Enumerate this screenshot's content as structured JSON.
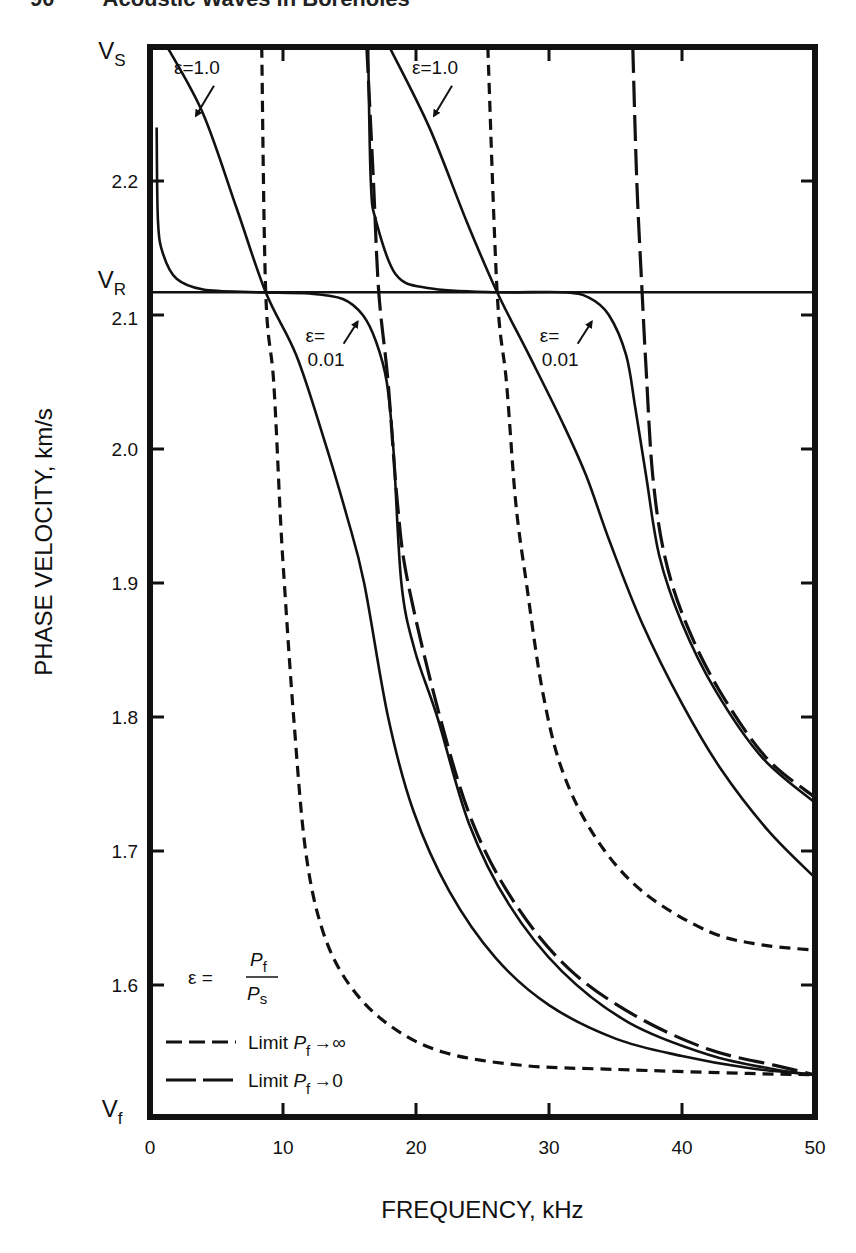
{
  "page": {
    "header": "90        Acoustic Waves in Boreholes"
  },
  "chart_data": {
    "type": "line",
    "title": "",
    "xlabel": "FREQUENCY, kHz",
    "ylabel": "PHASE VELOCITY, km/s",
    "xlim": [
      0,
      50
    ],
    "ylim": [
      1.503,
      2.3
    ],
    "grid": false,
    "x_ticks": [
      0,
      10,
      20,
      30,
      40,
      50
    ],
    "x_tick_labels": [
      "0",
      "10",
      "20",
      "30",
      "40",
      "50"
    ],
    "y_ticks": [
      1.6,
      1.7,
      1.8,
      1.9,
      2.0,
      2.1,
      2.2
    ],
    "y_tick_labels": [
      "1.6",
      "1.7",
      "1.8",
      "1.9",
      "2.0",
      "2.1",
      "2.2"
    ],
    "y_special_labels": [
      {
        "label": "V",
        "sub": "S",
        "value": 2.3
      },
      {
        "label": "V",
        "sub": "R",
        "value": 2.117
      },
      {
        "label": "V",
        "sub": "f",
        "value": 1.503
      }
    ],
    "reference_lines": [
      {
        "name": "V_R (Rayleigh velocity)",
        "value": 2.117,
        "orientation": "horizontal"
      }
    ],
    "legend": {
      "position": "lower-left",
      "formula": {
        "lhs": "ε =",
        "numerator": "P",
        "numerator_sub": "f",
        "denominator": "P",
        "denominator_sub": "s"
      },
      "entries": [
        {
          "style": "short-dash",
          "label": "Limit ",
          "var": "P",
          "sub": "f",
          "arrow": "→",
          "target": "∞"
        },
        {
          "style": "long-dash",
          "label": "Limit ",
          "var": "P",
          "sub": "f",
          "arrow": "→",
          "target": "0"
        }
      ]
    },
    "annotations": [
      {
        "text": "ε=1.0",
        "mode": 1,
        "x": 1.8,
        "y": 2.28
      },
      {
        "text": "ε=1.0",
        "mode": 2,
        "x": 19.7,
        "y": 2.28
      },
      {
        "text": "ε=",
        "text2": "0.01",
        "mode": 1,
        "x": 11.7,
        "y": 2.08
      },
      {
        "text": "ε=",
        "text2": "0.01",
        "mode": 2,
        "x": 29.3,
        "y": 2.08
      }
    ],
    "series": [
      {
        "name": "Mode 1, Limit Pf→∞",
        "style": "short-dash",
        "points": [
          [
            8.4,
            2.3
          ],
          [
            8.7,
            2.117
          ],
          [
            9.3,
            2.05
          ],
          [
            9.8,
            1.95
          ],
          [
            10.1,
            1.9
          ],
          [
            10.8,
            1.8
          ],
          [
            11.7,
            1.7
          ],
          [
            13,
            1.64
          ],
          [
            15,
            1.6
          ],
          [
            18,
            1.57
          ],
          [
            22,
            1.55
          ],
          [
            28,
            1.54
          ],
          [
            35,
            1.537
          ],
          [
            45,
            1.534
          ],
          [
            50,
            1.533
          ]
        ]
      },
      {
        "name": "Mode 1, ε=1.0",
        "style": "solid",
        "points": [
          [
            1.3,
            2.3
          ],
          [
            4,
            2.25
          ],
          [
            6.5,
            2.18
          ],
          [
            8.7,
            2.117
          ],
          [
            11,
            2.07
          ],
          [
            13,
            2.01
          ],
          [
            14.8,
            1.95
          ],
          [
            16.1,
            1.9
          ],
          [
            17.9,
            1.8
          ],
          [
            19.8,
            1.73
          ],
          [
            22.5,
            1.67
          ],
          [
            26,
            1.62
          ],
          [
            30,
            1.585
          ],
          [
            35,
            1.56
          ],
          [
            40,
            1.547
          ],
          [
            45,
            1.538
          ],
          [
            50,
            1.533
          ]
        ]
      },
      {
        "name": "Mode 1, ε=0.01",
        "style": "solid",
        "points": [
          [
            0.5,
            2.24
          ],
          [
            0.6,
            2.17
          ],
          [
            1,
            2.145
          ],
          [
            2,
            2.127
          ],
          [
            4,
            2.119
          ],
          [
            8,
            2.117
          ],
          [
            12,
            2.116
          ],
          [
            14.5,
            2.112
          ],
          [
            16,
            2.1
          ],
          [
            17,
            2.08
          ],
          [
            17.8,
            2.05
          ],
          [
            18.3,
            2.0
          ],
          [
            18.9,
            1.9
          ],
          [
            19.9,
            1.85
          ],
          [
            21.6,
            1.8
          ],
          [
            24,
            1.72
          ],
          [
            27,
            1.66
          ],
          [
            31,
            1.61
          ],
          [
            36,
            1.572
          ],
          [
            42,
            1.548
          ],
          [
            47,
            1.537
          ],
          [
            50,
            1.533
          ]
        ]
      },
      {
        "name": "Mode 1, Limit Pf→0",
        "style": "long-dash",
        "points": [
          [
            16.3,
            2.3
          ],
          [
            16.8,
            2.2
          ],
          [
            17.2,
            2.117
          ],
          [
            17.9,
            2.05
          ],
          [
            18.6,
            1.96
          ],
          [
            19.4,
            1.9
          ],
          [
            21.8,
            1.8
          ],
          [
            24.3,
            1.72
          ],
          [
            27.5,
            1.66
          ],
          [
            31.5,
            1.612
          ],
          [
            36.5,
            1.577
          ],
          [
            42,
            1.552
          ],
          [
            47,
            1.54
          ],
          [
            50,
            1.533
          ]
        ]
      },
      {
        "name": "Mode 2, Limit Pf→∞",
        "style": "short-dash",
        "points": [
          [
            25.4,
            2.3
          ],
          [
            26.1,
            2.117
          ],
          [
            26.8,
            2.05
          ],
          [
            27.5,
            1.96
          ],
          [
            28.3,
            1.9
          ],
          [
            29.5,
            1.82
          ],
          [
            31,
            1.76
          ],
          [
            33.5,
            1.71
          ],
          [
            37,
            1.67
          ],
          [
            42,
            1.64
          ],
          [
            46,
            1.63
          ],
          [
            50,
            1.626
          ]
        ]
      },
      {
        "name": "Mode 2, ε=1.0",
        "style": "solid",
        "points": [
          [
            18,
            2.3
          ],
          [
            21,
            2.24
          ],
          [
            23.8,
            2.17
          ],
          [
            26.1,
            2.117
          ],
          [
            28.5,
            2.07
          ],
          [
            31,
            2.02
          ],
          [
            32.8,
            1.98
          ],
          [
            34.6,
            1.93
          ],
          [
            37,
            1.87
          ],
          [
            40,
            1.81
          ],
          [
            43,
            1.76
          ],
          [
            46.5,
            1.715
          ],
          [
            50,
            1.68
          ]
        ]
      },
      {
        "name": "Mode 2, ε=0.01",
        "style": "solid",
        "points": [
          [
            16.4,
            2.3
          ],
          [
            16.6,
            2.2
          ],
          [
            17,
            2.17
          ],
          [
            18.5,
            2.13
          ],
          [
            21,
            2.12
          ],
          [
            26,
            2.117
          ],
          [
            31,
            2.117
          ],
          [
            33,
            2.113
          ],
          [
            34.5,
            2.1
          ],
          [
            35.8,
            2.07
          ],
          [
            36.5,
            2.03
          ],
          [
            37.3,
            1.98
          ],
          [
            38.3,
            1.92
          ],
          [
            40,
            1.87
          ],
          [
            42.5,
            1.82
          ],
          [
            46,
            1.77
          ],
          [
            50,
            1.736
          ]
        ]
      },
      {
        "name": "Mode 2, Limit Pf→0",
        "style": "long-dash",
        "points": [
          [
            36.3,
            2.3
          ],
          [
            36.6,
            2.2
          ],
          [
            37,
            2.117
          ],
          [
            37.3,
            2.06
          ],
          [
            37.8,
            1.98
          ],
          [
            38.7,
            1.92
          ],
          [
            40.3,
            1.87
          ],
          [
            42.8,
            1.82
          ],
          [
            46.3,
            1.77
          ],
          [
            50,
            1.74
          ]
        ]
      }
    ]
  },
  "layout": {
    "plot": {
      "left": 150,
      "right": 815,
      "top": 47,
      "bottom": 1117
    },
    "y_ref": {
      "value": 2.2,
      "px": 181,
      "px_per_unit": 1340
    },
    "colors": {
      "ink": "#111111",
      "background": "#ffffff"
    }
  }
}
